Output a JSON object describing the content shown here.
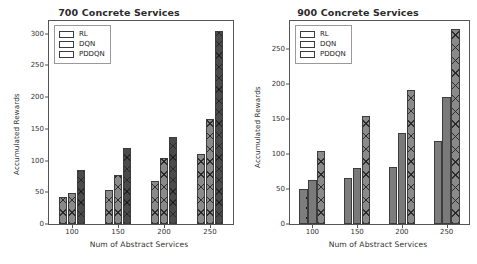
{
  "chart_data": [
    {
      "type": "bar",
      "title": "700 Concrete Services",
      "xlabel": "Num of Abstract Services",
      "ylabel": "Accumulated Rewards",
      "categories": [
        "100",
        "150",
        "200",
        "250"
      ],
      "ylim": [
        0,
        320
      ],
      "yticks": [
        0,
        50,
        100,
        150,
        200,
        250,
        300
      ],
      "grid": false,
      "legend_position": "upper left",
      "series": [
        {
          "name": "RL",
          "values": [
            42,
            54,
            68,
            110
          ],
          "pattern": "xhatch",
          "color": "#8a8a8a"
        },
        {
          "name": "DQN",
          "values": [
            49,
            78,
            104,
            165
          ],
          "pattern": "xhatch",
          "color": "#8a8a8a"
        },
        {
          "name": "PDDQN",
          "values": [
            85,
            120,
            137,
            305
          ],
          "pattern": "dark",
          "color": "#4a4a4a"
        }
      ]
    },
    {
      "type": "bar",
      "title": "900 Concrete Services",
      "xlabel": "Num of Abstract Services",
      "ylabel": "Accumulated Rewards",
      "categories": [
        "100",
        "150",
        "200",
        "250"
      ],
      "ylim": [
        0,
        290
      ],
      "yticks": [
        0,
        50,
        100,
        150,
        200,
        250
      ],
      "grid": false,
      "legend_position": "upper left",
      "series": [
        {
          "name": "RL",
          "values": [
            50,
            66,
            82,
            118
          ],
          "pattern": "dots",
          "color": "#7d7d7d"
        },
        {
          "name": "DQN",
          "values": [
            63,
            80,
            130,
            181
          ],
          "pattern": "plain",
          "color": "#7a7a7a"
        },
        {
          "name": "PDDQN",
          "values": [
            105,
            154,
            192,
            279
          ],
          "pattern": "xhatch",
          "color": "#8a8a8a"
        }
      ]
    }
  ]
}
